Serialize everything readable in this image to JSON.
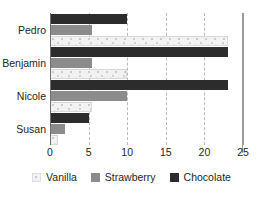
{
  "chart_data": {
    "type": "bar",
    "orientation": "horizontal",
    "title": "",
    "xlabel": "",
    "ylabel": "",
    "categories": [
      "Pedro",
      "Benjamin",
      "Nicole",
      "Susan"
    ],
    "series": [
      {
        "name": "Vanilla",
        "values": [
          23,
          10,
          5.5,
          1
        ],
        "color": "#f2f2f2"
      },
      {
        "name": "Strawberry",
        "values": [
          5.5,
          5.5,
          10,
          2
        ],
        "color": "#8c8c8c"
      },
      {
        "name": "Chocolate",
        "values": [
          10,
          23,
          23,
          5
        ],
        "color": "#2c2c2c"
      }
    ],
    "bar_order_top_to_bottom": [
      "Chocolate",
      "Strawberry",
      "Vanilla"
    ],
    "xlim": [
      0,
      25
    ],
    "xticks": [
      0,
      5,
      10,
      15,
      20,
      25
    ],
    "xtick_labels": [
      "0",
      "5",
      "10",
      "15",
      "20",
      "25"
    ],
    "grid": true,
    "gridlines_at": [
      5,
      10,
      15,
      20,
      25
    ],
    "legend_position": "bottom",
    "legend_entries": [
      "Vanilla",
      "Strawberry",
      "Chocolate"
    ]
  },
  "axis": {
    "ticks": [
      {
        "label": "0",
        "value": 0
      },
      {
        "label": "5",
        "value": 5
      },
      {
        "label": "10",
        "value": 10
      },
      {
        "label": "15",
        "value": 15
      },
      {
        "label": "20",
        "value": 20
      },
      {
        "label": "25",
        "value": 25
      }
    ]
  },
  "legend": {
    "items": [
      {
        "label": "Vanilla",
        "key": "vanilla"
      },
      {
        "label": "Strawberry",
        "key": "strawberry"
      },
      {
        "label": "Chocolate",
        "key": "chocolate"
      }
    ]
  }
}
